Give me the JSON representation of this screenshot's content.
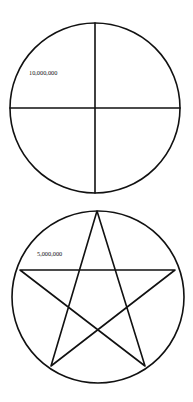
{
  "diagrams": [
    {
      "type": "circle-divided-quarters",
      "label": "10,000,000",
      "circle": {
        "cx": 95,
        "cy": 108,
        "r": 85
      },
      "label_pos": {
        "x": 29,
        "y": 74.5
      }
    },
    {
      "type": "pentagram-in-circle",
      "label": "5,000,000",
      "circle": {
        "cx": 98,
        "cy": 297,
        "r": 86
      },
      "star_points": [
        [
          97,
          211
        ],
        [
          175,
          270
        ],
        [
          145,
          366
        ],
        [
          51,
          366
        ],
        [
          20,
          270
        ]
      ],
      "label_pos": {
        "x": 37,
        "y": 255.5
      }
    }
  ],
  "colors": {
    "stroke": "#111111",
    "background": "#ffffff"
  }
}
